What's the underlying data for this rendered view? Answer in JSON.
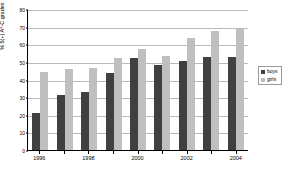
{
  "chart_data": {
    "type": "bar",
    "title": "",
    "xlabel": "",
    "ylabel": "% 5(+) A*-C grades",
    "ylim": [
      0,
      80
    ],
    "ytick_values": [
      0,
      10,
      20,
      30,
      40,
      50,
      60,
      70,
      80
    ],
    "ytick_labels": [
      "0",
      "10",
      "20",
      "30",
      "40",
      "50",
      "60",
      "70",
      "80"
    ],
    "grid": true,
    "grid_axis": "y",
    "legend_position": "right",
    "categories": [
      "1996",
      "",
      "1998",
      "",
      "2000",
      "",
      "2002",
      "",
      "2004"
    ],
    "xtick_labels": [
      "1996",
      "1998",
      "2000",
      "2002",
      "2004"
    ],
    "series": [
      {
        "name": "boys",
        "color": "#404040",
        "values": [
          21,
          31,
          33,
          43.5,
          52,
          48.5,
          50.5,
          53,
          53
        ]
      },
      {
        "name": "girls",
        "color": "#bfbfbf",
        "values": [
          44,
          46,
          46.5,
          52,
          57.5,
          53.5,
          63.5,
          67.5,
          68.5
        ]
      }
    ]
  },
  "legend": {
    "items": [
      {
        "label": "boys",
        "color": "#404040"
      },
      {
        "label": "girls",
        "color": "#bfbfbf"
      }
    ]
  },
  "axis": {
    "y_title": "% 5(+) A*-C grades"
  }
}
